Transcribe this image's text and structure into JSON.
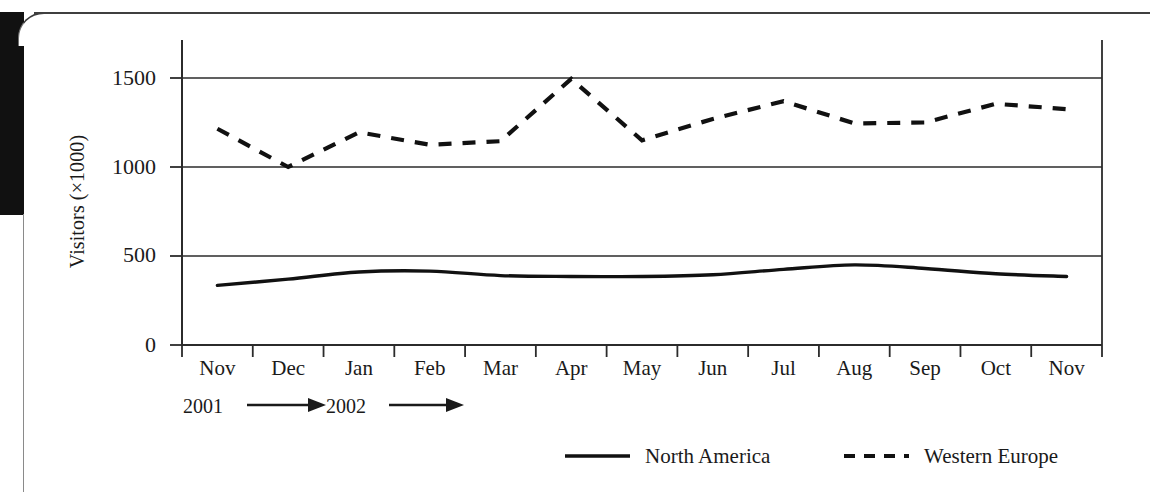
{
  "figure": {
    "y_axis_title": "Visitors (×1000)",
    "y_ticks": [
      "0",
      "500",
      "1000",
      "1500"
    ],
    "x_ticks": [
      "Nov",
      "Dec",
      "Jan",
      "Feb",
      "Mar",
      "Apr",
      "May",
      "Jun",
      "Jul",
      "Aug",
      "Sep",
      "Oct",
      "Nov"
    ],
    "era_labels": [
      "2001",
      "2002"
    ],
    "arrow_icon": "right-arrow-icon",
    "legend": [
      {
        "label": "North America",
        "style": "solid",
        "color": "#111111"
      },
      {
        "label": "Western Europe",
        "style": "dashed",
        "color": "#111111"
      }
    ],
    "colors": {
      "line": "#111111",
      "grid": "#2b2b2b",
      "axis": "#2b2b2b",
      "page": "#ffffff",
      "scan_edge": "#111111"
    }
  },
  "chart_data": {
    "type": "line",
    "title": "",
    "subtitle": "",
    "xlabel": "",
    "ylabel": "Visitors (×1000)",
    "categories": [
      "Nov",
      "Dec",
      "Jan",
      "Feb",
      "Mar",
      "Apr",
      "May",
      "Jun",
      "Jul",
      "Aug",
      "Sep",
      "Oct",
      "Nov"
    ],
    "category_years": [
      "2001",
      "2001",
      "2002",
      "2002",
      "2002",
      "2002",
      "2002",
      "2002",
      "2002",
      "2002",
      "2002",
      "2002",
      "2002"
    ],
    "ylim": [
      0,
      1500
    ],
    "yticks": [
      0,
      500,
      1000,
      1500
    ],
    "grid": true,
    "legend_position": "bottom",
    "series": [
      {
        "name": "North America",
        "style": "solid",
        "values": [
          335,
          370,
          410,
          415,
          390,
          385,
          385,
          395,
          425,
          450,
          430,
          400,
          385
        ]
      },
      {
        "name": "Western Europe",
        "style": "dashed",
        "values": [
          1215,
          1000,
          1195,
          1125,
          1145,
          1495,
          1150,
          1270,
          1370,
          1245,
          1250,
          1355,
          1325
        ]
      }
    ]
  }
}
